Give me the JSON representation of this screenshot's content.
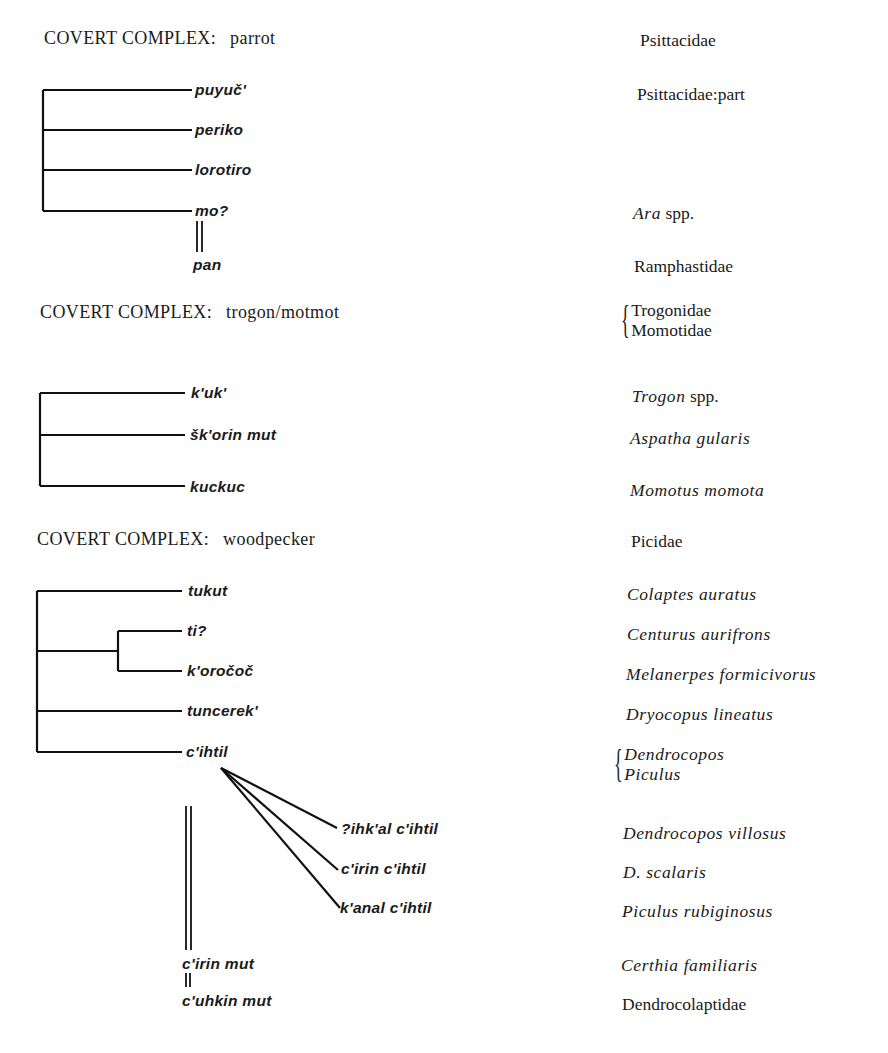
{
  "sections": [
    {
      "heading": {
        "label": "COVERT COMPLEX:",
        "name": "parrot"
      },
      "family": "Psittacidae",
      "terms": [
        {
          "term": "puyuč'",
          "gloss": "Psittacidae:part",
          "gloss_style": "roman"
        },
        {
          "term": "periko",
          "gloss": ""
        },
        {
          "term": "lorotiro",
          "gloss": ""
        },
        {
          "term": "mo?",
          "gloss_genus": "Ara",
          "gloss_rest": "spp."
        },
        {
          "term": "pan",
          "gloss": "Ramphastidae",
          "gloss_style": "roman",
          "relation": "double-line from mo?"
        }
      ]
    },
    {
      "heading": {
        "label": "COVERT COMPLEX:",
        "name": "trogon/motmot"
      },
      "family_brace": [
        "Trogonidae",
        "Momotidae"
      ],
      "terms": [
        {
          "term": "k'uk'",
          "gloss_genus": "Trogon",
          "gloss_rest": "spp."
        },
        {
          "term": "šk'orin mut",
          "gloss": "Aspatha gularis",
          "gloss_style": "italic"
        },
        {
          "term": "kuckuc",
          "gloss": "Momotus momota",
          "gloss_style": "italic"
        }
      ]
    },
    {
      "heading": {
        "label": "COVERT COMPLEX:",
        "name": "woodpecker"
      },
      "family": "Picidae",
      "terms": [
        {
          "term": "tukut",
          "gloss": "Colaptes auratus",
          "gloss_style": "italic"
        },
        {
          "term": "ti?",
          "gloss": "Centurus aurifrons",
          "gloss_style": "italic"
        },
        {
          "term": "k'oročoč",
          "gloss": "Melanerpes formicivorus",
          "gloss_style": "italic"
        },
        {
          "term": "tuncerek'",
          "gloss": "Dryocopus lineatus",
          "gloss_style": "italic"
        },
        {
          "term": "c'ihtil",
          "gloss_brace": [
            "Dendrocopos",
            "Piculus"
          ],
          "gloss_style": "italic"
        },
        {
          "term": "?ihk'al c'ihtil",
          "gloss": "Dendrocopos villosus",
          "gloss_style": "italic"
        },
        {
          "term": "c'irin c'ihtil",
          "gloss": "D. scalaris",
          "gloss_style": "italic"
        },
        {
          "term": "k'anal c'ihtil",
          "gloss": "Piculus rubiginosus",
          "gloss_style": "italic"
        },
        {
          "term": "c'irin mut",
          "gloss": "Certhia familiaris",
          "gloss_style": "italic",
          "relation": "double-line from c'ihtil group"
        },
        {
          "term": "c'uhkin mut",
          "gloss": "Dendrocolaptidae",
          "gloss_style": "roman",
          "relation": "double-line from c'irin mut"
        }
      ]
    }
  ],
  "brace_glyph": "{"
}
